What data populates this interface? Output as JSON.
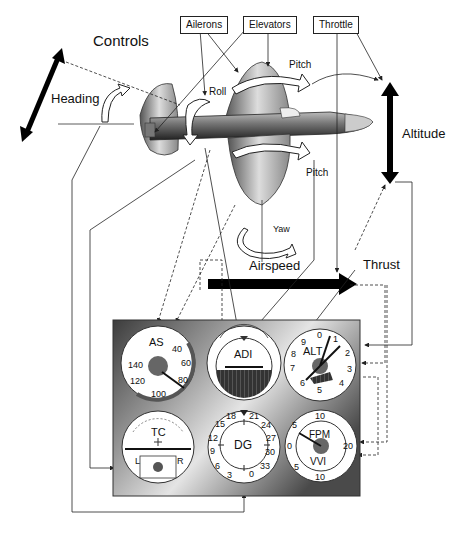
{
  "title": "Controls",
  "control_boxes": {
    "ailerons": "Ailerons",
    "elevators": "Elevators",
    "throttle": "Throttle"
  },
  "motion_labels": {
    "heading": "Heading",
    "roll": "Roll",
    "pitch_top": "Pitch",
    "pitch_bottom": "Pitch",
    "yaw": "Yaw",
    "altitude": "Altitude",
    "airspeed": "Airspeed",
    "thrust": "Thrust"
  },
  "instruments": {
    "as": {
      "label": "AS",
      "ticks": [
        "40",
        "60",
        "80",
        "100",
        "120",
        "140"
      ]
    },
    "adi": {
      "label": "ADI"
    },
    "alt": {
      "label": "ALT",
      "ticks": [
        "0",
        "1",
        "2",
        "3",
        "4",
        "5",
        "6",
        "7",
        "8",
        "9"
      ]
    },
    "tc": {
      "label": "TC",
      "left": "L",
      "right": "R"
    },
    "dg": {
      "label": "DG",
      "ticks": [
        "0",
        "3",
        "6",
        "9",
        "12",
        "15",
        "18",
        "21",
        "24",
        "27",
        "30",
        "33"
      ]
    },
    "vvi": {
      "label_top": "FPM",
      "label_bottom": "VVI",
      "ticks": [
        "10",
        "5",
        "0",
        "5",
        "10",
        "20"
      ]
    }
  },
  "colors": {
    "panel_dark": "#3a3a3a",
    "panel_light": "#e8e8e8",
    "line": "#222222",
    "arrow_fill": "#000000"
  }
}
